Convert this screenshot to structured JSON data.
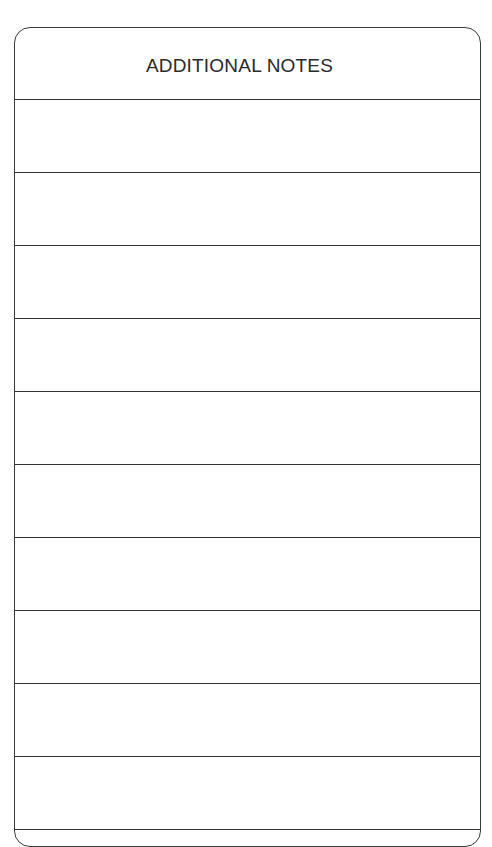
{
  "notes": {
    "title": "ADDITIONAL NOTES",
    "rows": [
      {
        "value": ""
      },
      {
        "value": ""
      },
      {
        "value": ""
      },
      {
        "value": ""
      },
      {
        "value": ""
      },
      {
        "value": ""
      },
      {
        "value": ""
      },
      {
        "value": ""
      },
      {
        "value": ""
      },
      {
        "value": ""
      }
    ]
  },
  "colors": {
    "line": "#333333",
    "text": "#2a2a2a",
    "background": "#ffffff"
  }
}
